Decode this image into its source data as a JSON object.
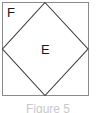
{
  "figure": {
    "kind": "geometry-diagram",
    "caption": "Figure 5",
    "colors": {
      "stroke": "#3a3a3a",
      "outer_stroke": "#8a8a8a",
      "fill": "#ffffff",
      "label": "#1a1a1a",
      "caption": "#c9c9c9",
      "background": "#ffffff"
    },
    "outer_square": {
      "label": "F",
      "x": 2,
      "y": 2,
      "width": 86,
      "height": 94
    },
    "inner_diamond": {
      "label": "E",
      "points": "45,2 88,49 45,95 2,49"
    },
    "labels": [
      {
        "text": "F",
        "name": "outer-region-label"
      },
      {
        "text": "E",
        "name": "inner-region-label"
      }
    ]
  }
}
